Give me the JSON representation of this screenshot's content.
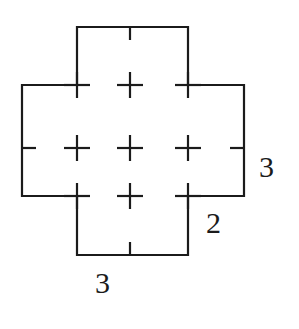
{
  "figure": {
    "background_color": "#ffffff",
    "stroke_color": "#1b1b1b",
    "stroke_width": 2,
    "canvas": {
      "width": 299,
      "height": 329
    },
    "geometry": {
      "grid_x": [
        22,
        77,
        130,
        188,
        244
      ],
      "grid_y": [
        27,
        85,
        148,
        196,
        255
      ],
      "cell_width": 55,
      "cell_height": 58,
      "outline_points": [
        [
          77,
          27
        ],
        [
          188,
          27
        ],
        [
          188,
          85
        ],
        [
          244,
          85
        ],
        [
          244,
          196
        ],
        [
          188,
          196
        ],
        [
          188,
          255
        ],
        [
          77,
          255
        ],
        [
          77,
          196
        ],
        [
          22,
          196
        ],
        [
          22,
          85
        ],
        [
          77,
          85
        ]
      ],
      "plus_marks": [
        {
          "x": 130,
          "y": 85
        },
        {
          "x": 188,
          "y": 85
        },
        {
          "x": 77,
          "y": 148
        },
        {
          "x": 130,
          "y": 148
        },
        {
          "x": 188,
          "y": 148
        },
        {
          "x": 77,
          "y": 196
        },
        {
          "x": 130,
          "y": 196
        },
        {
          "x": 77,
          "y": 85
        }
      ],
      "edge_ticks": [
        {
          "x": 130,
          "y": 27,
          "dir": "down",
          "length": 11
        },
        {
          "x": 22,
          "y": 148,
          "dir": "right",
          "length": 13
        },
        {
          "x": 244,
          "y": 148,
          "dir": "left",
          "length": 13
        },
        {
          "x": 130,
          "y": 255,
          "dir": "up",
          "length": 11
        }
      ]
    },
    "labels": [
      {
        "id": "label-right",
        "text": "3",
        "side": "right",
        "x": 259,
        "y": 152
      },
      {
        "id": "label-corner",
        "text": "2",
        "side": "bottom-right",
        "x": 206,
        "y": 208
      },
      {
        "id": "label-bottom",
        "text": "3",
        "side": "bottom",
        "x": 95,
        "y": 268
      }
    ],
    "measurements": {
      "right_side": "3",
      "lower_right_side": "2",
      "bottom_side": "3"
    }
  }
}
